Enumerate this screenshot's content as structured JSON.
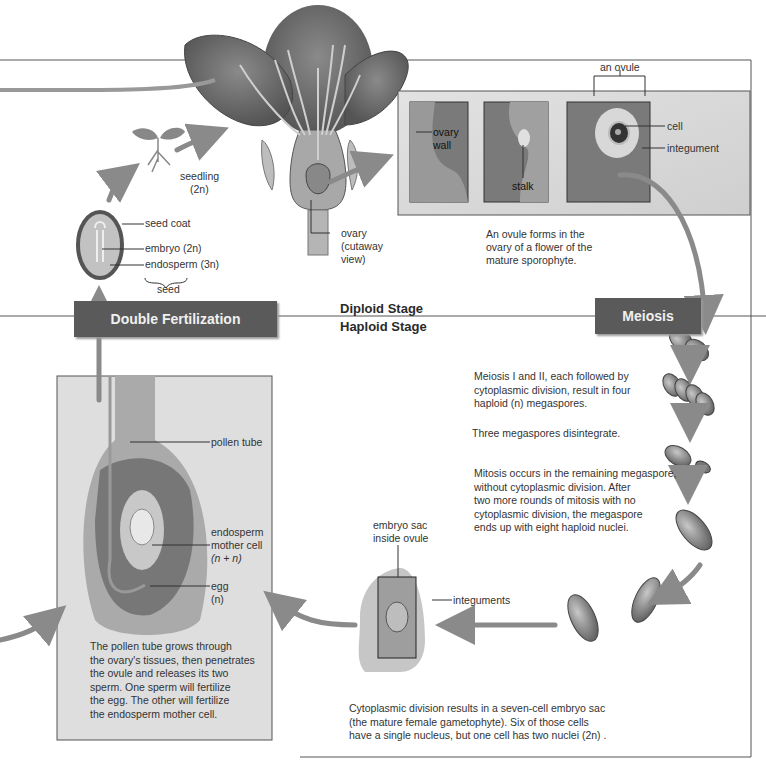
{
  "stages": {
    "diploid": "Diploid Stage",
    "haploid": "Haploid Stage"
  },
  "banners": {
    "double_fertilization": "Double Fertilization",
    "meiosis": "Meiosis"
  },
  "flower": {
    "ovary_label_1": "ovary",
    "ovary_label_2": "(cutaway",
    "ovary_label_3": "view)"
  },
  "seedling": {
    "label": "seedling",
    "ploidy": "(2n)"
  },
  "seed": {
    "seed_coat": "seed coat",
    "embryo": "embryo (2n)",
    "endosperm": "endosperm (3n)",
    "seed": "seed"
  },
  "ovule_panel": {
    "an_ovule": "an ovule",
    "ovary_wall_1": "ovary",
    "ovary_wall_2": "wall",
    "stalk": "stalk",
    "cell": "cell",
    "integument": "integument",
    "caption_1": "An ovule forms in the",
    "caption_2": "ovary of a flower of the",
    "caption_3": "mature sporophyte."
  },
  "meiosis_text": {
    "p1_1": "Meiosis I and II, each followed by",
    "p1_2": "cytoplasmic division, result in four",
    "p1_3": "haploid (n) megaspores.",
    "p2": "Three megaspores disintegrate.",
    "p3_1": "Mitosis occurs in the remaining megaspore,",
    "p3_2": "without cytoplasmic  division. After",
    "p3_3": "two more rounds of mitosis with no",
    "p3_4": "cytoplasmic division, the megaspore",
    "p3_5": "ends up with eight haploid nuclei."
  },
  "embryo_sac": {
    "label_1": "embryo sac",
    "label_2": "inside ovule",
    "integuments": "integuments",
    "caption_1": "Cytoplasmic division results in a seven-cell embryo sac",
    "caption_2": "(the mature female gametophyte). Six of those cells",
    "caption_3": "have a single nucleus, but one cell has two nuclei (2n) ."
  },
  "pollen_panel": {
    "pollen_tube": "pollen tube",
    "endosperm_1": "endosperm",
    "endosperm_2": "mother cell",
    "endosperm_3": "(n + n)",
    "egg_1": "egg",
    "egg_2": "(n)",
    "caption_1": "The pollen tube grows through",
    "caption_2": "the ovary's tissues, then penetrates",
    "caption_3": "the ovule and releases its two",
    "caption_4": "sperm. One sperm will fertilize",
    "caption_5": "the egg. The other will fertilize",
    "caption_6": "the endosperm mother cell."
  },
  "colors": {
    "arrow": "#8a8a8a",
    "banner": "#5a5a5a",
    "panel": "#dcdcdc",
    "tissue_dark": "#6e6e6e",
    "tissue_light": "#b8b8b8"
  }
}
